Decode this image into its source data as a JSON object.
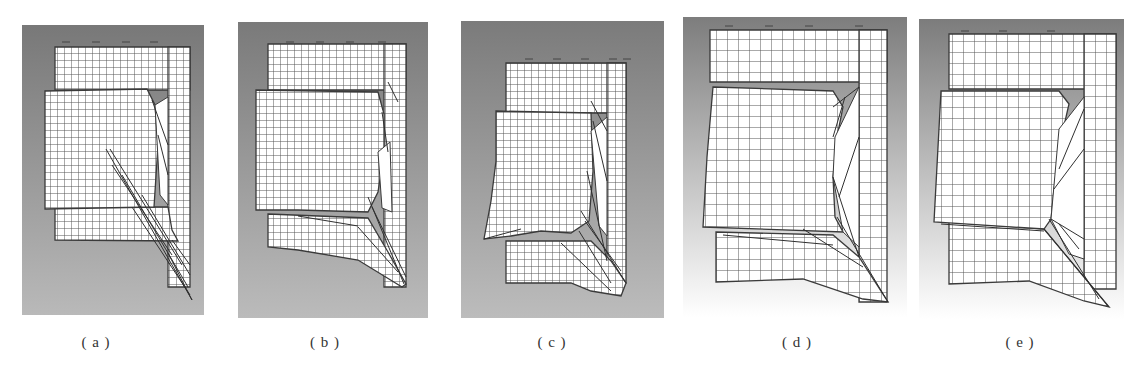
{
  "figure": {
    "caption": "",
    "mesh_line_color": "#555555",
    "edge_color": "#3a3a3a",
    "sheet_fill": "#ffffff"
  },
  "panels": [
    {
      "id": "a",
      "label": "( a )",
      "x": 22,
      "y": 25,
      "w": 182,
      "h": 290,
      "bg_top": "#787878",
      "bg_bottom": "#b9b9b9",
      "cell": 7,
      "label_x": 96,
      "label_y": 334,
      "sheets": [
        {
          "name": "back-top-sheet",
          "points": "33,22 168,22 168,65 33,65"
        },
        {
          "name": "right-column",
          "points": "146,22 168,22 168,262 146,262"
        },
        {
          "name": "lower-strip",
          "points": "33,182 146,182 150,205 156,216 33,215"
        },
        {
          "name": "front-sheet",
          "points": "23,66 125,64 133,80 136,120 132,182 23,184"
        }
      ],
      "slits": [
        {
          "points": "133,80 146,72 146,180 138,170"
        }
      ],
      "creases": [
        "84,124 170,275",
        "88,124 160,240",
        "90,140 150,230",
        "100,150 166,262",
        "130,75 146,120",
        "136,110 146,150",
        "120,170 168,250",
        "110,182 168,270",
        "146,228 170,275",
        "150,215 168,240"
      ],
      "ticks": [
        [
          40,
          17
        ],
        [
          70,
          17
        ],
        [
          100,
          17
        ],
        [
          128,
          17
        ]
      ]
    },
    {
      "id": "b",
      "label": "( b )",
      "x": 238,
      "y": 22,
      "w": 190,
      "h": 296,
      "bg_top": "#7a7a7a",
      "bg_bottom": "#bbbbbb",
      "cell": 7,
      "label_x": 325,
      "label_y": 334,
      "sheets": [
        {
          "name": "back-top-sheet",
          "points": "30,22 168,22 168,68 30,68"
        },
        {
          "name": "right-column",
          "points": "146,22 168,22 168,265 146,265"
        },
        {
          "name": "lower-strip",
          "points": "30,192 130,196 150,230 168,262 164,265 120,238 60,228 30,225"
        },
        {
          "name": "front-sheet",
          "points": "18,68 140,70 146,92 146,130 140,170 130,190 60,188 18,188"
        }
      ],
      "slits": [
        {
          "points": "140,130 152,120 154,190 144,186"
        }
      ],
      "creases": [
        "130,175 166,262",
        "134,185 168,255",
        "120,205 160,250",
        "150,60 160,80",
        "144,90 150,130",
        "60,194 120,204"
      ],
      "ticks": [
        [
          48,
          20
        ],
        [
          78,
          20
        ],
        [
          108,
          20
        ],
        [
          140,
          20
        ]
      ]
    },
    {
      "id": "c",
      "label": "( c )",
      "x": 461,
      "y": 21,
      "w": 203,
      "h": 297,
      "bg_top": "#7b7b7b",
      "bg_bottom": "#bcbcbc",
      "cell": 7,
      "label_x": 552,
      "label_y": 334,
      "sheets": [
        {
          "name": "back-top-sheet",
          "points": "45,42 165,42 165,92 45,92"
        },
        {
          "name": "right-column",
          "points": "146,42 165,42 165,262 146,262"
        },
        {
          "name": "lower-strip",
          "points": "45,220 130,220 150,240 165,262 160,275 130,270 110,262 45,262"
        },
        {
          "name": "front-sheet",
          "points": "35,90 130,92 132,150 128,200 110,212 80,210 50,215 23,218 30,180 35,140"
        }
      ],
      "slits": [
        {
          "points": "130,110 146,96 146,215 138,205"
        }
      ],
      "creases": [
        "120,190 165,262",
        "124,200 160,250",
        "118,210 150,262",
        "126,150 146,240",
        "132,100 146,160",
        "23,218 60,208",
        "100,222 150,270",
        "130,80 146,110"
      ],
      "ticks": [
        [
          64,
          38
        ],
        [
          92,
          38
        ],
        [
          120,
          38
        ],
        [
          148,
          38
        ],
        [
          162,
          38
        ]
      ]
    },
    {
      "id": "d",
      "label": "( d )",
      "x": 683,
      "y": 17,
      "w": 224,
      "h": 300,
      "bg_top": "#7d7d7d",
      "bg_bottom": "#ffffff",
      "cell": 11,
      "label_x": 797,
      "label_y": 334,
      "sheets": [
        {
          "name": "back-top-sheet",
          "points": "27,13 204,13 204,65 27,65"
        },
        {
          "name": "right-column",
          "points": "176,13 204,13 204,285 176,285"
        },
        {
          "name": "lower-strip",
          "points": "33,215 150,218 176,240 205,285 180,282 120,262 33,265"
        },
        {
          "name": "front-sheet",
          "points": "30,70 150,74 160,90 154,120 150,160 152,200 160,215 20,210 24,140"
        }
      ],
      "slits": [
        {
          "points": "152,120 176,70 176,230 160,215 150,160"
        }
      ],
      "creases": [
        "150,90 176,70",
        "150,160 176,240",
        "154,200 205,285",
        "120,212 180,250",
        "40,218 150,228",
        "150,120 162,80",
        "156,180 176,120"
      ],
      "ticks": [
        [
          42,
          9
        ],
        [
          82,
          9
        ],
        [
          122,
          9
        ],
        [
          172,
          9
        ]
      ]
    },
    {
      "id": "e",
      "label": "( e )",
      "x": 919,
      "y": 19,
      "w": 205,
      "h": 300,
      "bg_top": "#7c7c7c",
      "bg_bottom": "#ffffff",
      "cell": 11,
      "label_x": 1020,
      "label_y": 334,
      "sheets": [
        {
          "name": "back-top-sheet",
          "points": "30,15 197,15 197,70 30,70"
        },
        {
          "name": "right-column",
          "points": "165,15 197,15 197,270 165,270"
        },
        {
          "name": "lower-strip",
          "points": "30,203 125,210 150,240 190,288 165,282 110,262 30,265"
        },
        {
          "name": "front-sheet",
          "points": "22,72 140,72 150,85 142,120 135,170 132,200 125,210 15,203"
        }
      ],
      "slits": [
        {
          "points": "140,110 165,78 165,240 150,235 132,200"
        }
      ],
      "creases": [
        "125,210 190,288",
        "130,200 180,280",
        "140,150 165,90",
        "135,170 165,130",
        "132,200 165,220",
        "140,205 160,230",
        "22,205 125,212"
      ],
      "ticks": [
        [
          42,
          12
        ],
        [
          80,
          12
        ],
        [
          128,
          12
        ]
      ]
    }
  ]
}
